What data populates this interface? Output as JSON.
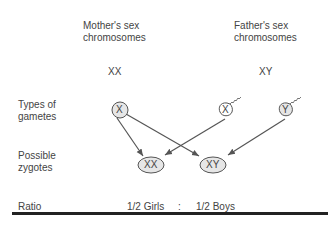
{
  "headers": {
    "mother": [
      "Mother's sex",
      "chromosomes"
    ],
    "father": [
      "Father's sex",
      "chromosomes"
    ]
  },
  "genotypes": {
    "mother": "XX",
    "father": "XY"
  },
  "row_labels": {
    "gametes": [
      "Types of",
      "gametes"
    ],
    "zygotes": [
      "Possible",
      "zygotes"
    ],
    "ratio": "Ratio"
  },
  "gametes": [
    {
      "label": "X",
      "source": "mother",
      "type": "egg"
    },
    {
      "label": "X",
      "source": "father",
      "type": "sperm"
    },
    {
      "label": "Y",
      "source": "father",
      "type": "sperm"
    }
  ],
  "zygotes": [
    {
      "label": "XX"
    },
    {
      "label": "XY"
    }
  ],
  "ratio": {
    "girls": "1/2 Girls",
    "sep": ":",
    "boys": "1/2 Boys"
  },
  "colors": {
    "stroke": "#555555",
    "fill": "#e6e6e6",
    "rule": "#222222"
  }
}
